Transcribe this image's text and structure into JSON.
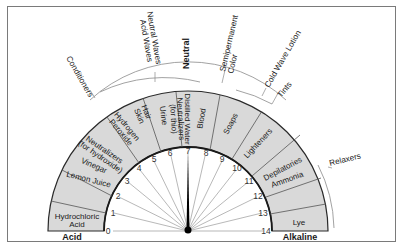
{
  "diagram": {
    "ends": {
      "left": "Acid",
      "right": "Alkaline"
    },
    "neutral_label": "Neutral",
    "scale": {
      "min": 0,
      "max": 14,
      "ticks": [
        "0",
        "1",
        "2",
        "3",
        "4",
        "5",
        "6",
        "7",
        "8",
        "9",
        "10",
        "11",
        "12",
        "13",
        "14"
      ],
      "needle_value": 7
    },
    "band_segments": [
      {
        "lines": [
          "Hydrochloric",
          "Acid"
        ]
      },
      {
        "lines": [
          "Lemon Juice"
        ]
      },
      {
        "lines": [
          "Vinegar"
        ]
      },
      {
        "lines": [
          "Neutralizers",
          "(for hydroxide)"
        ]
      },
      {
        "lines": [
          "Hydrogen",
          "Peroxide"
        ]
      },
      {
        "lines": [
          "Hair",
          "Skin"
        ]
      },
      {
        "lines": [
          "Urine"
        ]
      },
      {
        "lines": [
          "Neutralizers",
          "(for thio)"
        ]
      },
      {
        "lines": [
          "Distilled Water"
        ]
      },
      {
        "lines": [
          "Blood"
        ]
      },
      {
        "lines": [
          "Soaps"
        ]
      },
      {
        "lines": [
          "Lighteners"
        ]
      },
      {
        "lines": [
          "Depilatories"
        ]
      },
      {
        "lines": [
          "Ammonia"
        ]
      },
      {
        "lines": [
          "Lye"
        ]
      }
    ],
    "outer_labels": [
      {
        "lines": [
          "Conditioners"
        ]
      },
      {
        "lines": [
          "Neutral Waves",
          "Acid Waves"
        ]
      },
      {
        "lines": [
          "Semipermanent",
          "Color"
        ]
      },
      {
        "lines": [
          "Cold Wave Lotion"
        ]
      },
      {
        "lines": [
          "Tints"
        ]
      },
      {
        "lines": [
          "Relaxers"
        ]
      }
    ],
    "colors": {
      "band_fill": "#d9d9d9",
      "line": "#2a2a2a",
      "thin_line": "#8a8a8a",
      "needle": "#000000",
      "frame": "#7a7a7a"
    }
  }
}
